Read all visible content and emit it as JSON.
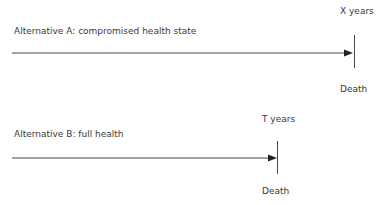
{
  "diagram": {
    "alternative_a": {
      "label": "Alternative A: compromised health state",
      "duration_label": "X years",
      "end_label": "Death"
    },
    "alternative_b": {
      "label": "Alternative B: full health",
      "duration_label": "T years",
      "end_label": "Death"
    },
    "colors": {
      "line": "#333333",
      "text": "#3a3a3a"
    }
  }
}
